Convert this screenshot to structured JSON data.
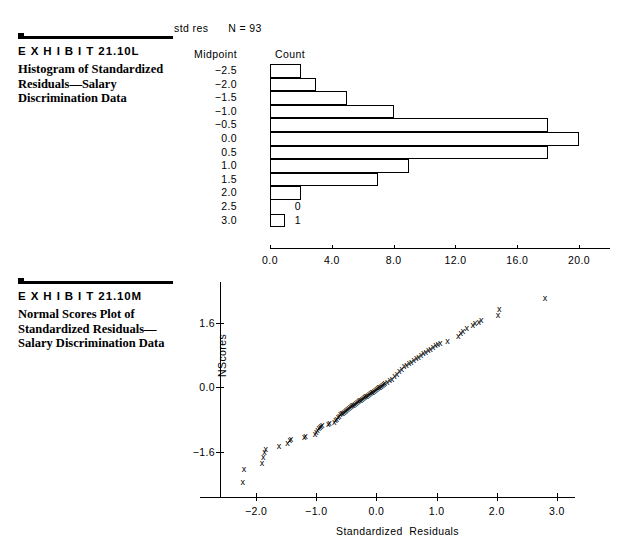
{
  "exhibit_l": {
    "label": "E X H I B I T   21.10L",
    "title": "Histogram of Standardized Residuals—Salary Discrimination Data",
    "header_line": "std res      N = 93",
    "column_headers": {
      "midpoint": "Midpoint",
      "count": "Count"
    }
  },
  "exhibit_m": {
    "label": "E X H I B I T   21.10M",
    "title": "Normal Scores Plot of Standardized Residuals—Salary Discrimination Data"
  },
  "chart_data": [
    {
      "type": "bar",
      "orientation": "horizontal",
      "title": "Histogram of Standardized Residuals—Salary Discrimination Data",
      "subtitle": "std res      N = 93",
      "xlabel": "",
      "ylabel": "Midpoint",
      "n": 93,
      "categories": [
        "-2.5",
        "-2.0",
        "-1.5",
        "-1.0",
        "-0.5",
        "0.0",
        "0.5",
        "1.0",
        "1.5",
        "2.0",
        "2.5",
        "3.0"
      ],
      "values": [
        2,
        3,
        5,
        8,
        18,
        20,
        18,
        9,
        7,
        2,
        0,
        1
      ],
      "xlim": [
        0,
        22
      ],
      "xticks": [
        0,
        4,
        8,
        12,
        16,
        20
      ],
      "xticklabels": [
        "0.0",
        "4.0",
        "8.0",
        "12.0",
        "16.0",
        "20.0"
      ],
      "grid": false,
      "legend": "none"
    },
    {
      "type": "scatter",
      "title": "Normal Scores Plot of Standardized Residuals—Salary Discrimination Data",
      "xlabel": "Standardized  Residuals",
      "ylabel": "NScores",
      "marker": "x",
      "xlim": [
        -2.6,
        3.3
      ],
      "ylim": [
        -2.7,
        2.6
      ],
      "xticks": [
        -2.0,
        -1.0,
        0.0,
        1.0,
        2.0,
        3.0
      ],
      "xticklabels": [
        "-2.0",
        "-1.0",
        "0.0",
        "1.0",
        "2.0",
        "3.0"
      ],
      "yticks": [
        1.6,
        0.0,
        -1.6
      ],
      "yticklabels": [
        "1.6",
        "0.0",
        "-1.6"
      ],
      "grid": false,
      "legend": "none",
      "points": [
        [
          -2.22,
          -2.34
        ],
        [
          -2.2,
          -2.02
        ],
        [
          -1.9,
          -1.86
        ],
        [
          -1.88,
          -1.72
        ],
        [
          -1.86,
          -1.58
        ],
        [
          -1.84,
          -1.52
        ],
        [
          -1.62,
          -1.45
        ],
        [
          -1.48,
          -1.36
        ],
        [
          -1.44,
          -1.3
        ],
        [
          -1.42,
          -1.28
        ],
        [
          -1.2,
          -1.22
        ],
        [
          -1.18,
          -1.2
        ],
        [
          -1.02,
          -1.14
        ],
        [
          -1.0,
          -1.1
        ],
        [
          -0.98,
          -1.04
        ],
        [
          -0.96,
          -1.0
        ],
        [
          -0.94,
          -0.97
        ],
        [
          -0.92,
          -0.94
        ],
        [
          -0.9,
          -0.92
        ],
        [
          -0.8,
          -0.9
        ],
        [
          -0.78,
          -0.88
        ],
        [
          -0.7,
          -0.84
        ],
        [
          -0.68,
          -0.8
        ],
        [
          -0.66,
          -0.78
        ],
        [
          -0.64,
          -0.74
        ],
        [
          -0.62,
          -0.7
        ],
        [
          -0.6,
          -0.66
        ],
        [
          -0.58,
          -0.64
        ],
        [
          -0.56,
          -0.62
        ],
        [
          -0.54,
          -0.6
        ],
        [
          -0.52,
          -0.58
        ],
        [
          -0.5,
          -0.55
        ],
        [
          -0.48,
          -0.52
        ],
        [
          -0.46,
          -0.5
        ],
        [
          -0.44,
          -0.48
        ],
        [
          -0.42,
          -0.46
        ],
        [
          -0.4,
          -0.44
        ],
        [
          -0.38,
          -0.42
        ],
        [
          -0.36,
          -0.4
        ],
        [
          -0.34,
          -0.38
        ],
        [
          -0.32,
          -0.36
        ],
        [
          -0.3,
          -0.34
        ],
        [
          -0.28,
          -0.32
        ],
        [
          -0.26,
          -0.3
        ],
        [
          -0.24,
          -0.28
        ],
        [
          -0.22,
          -0.26
        ],
        [
          -0.2,
          -0.24
        ],
        [
          -0.18,
          -0.22
        ],
        [
          -0.16,
          -0.2
        ],
        [
          -0.14,
          -0.18
        ],
        [
          -0.12,
          -0.16
        ],
        [
          -0.1,
          -0.14
        ],
        [
          -0.08,
          -0.12
        ],
        [
          -0.06,
          -0.1
        ],
        [
          -0.04,
          -0.08
        ],
        [
          -0.02,
          -0.06
        ],
        [
          0.0,
          -0.04
        ],
        [
          0.02,
          -0.02
        ],
        [
          0.04,
          0.0
        ],
        [
          0.06,
          0.02
        ],
        [
          0.08,
          0.04
        ],
        [
          0.1,
          0.06
        ],
        [
          0.12,
          0.08
        ],
        [
          0.14,
          0.1
        ],
        [
          0.18,
          0.14
        ],
        [
          0.22,
          0.18
        ],
        [
          0.26,
          0.22
        ],
        [
          0.3,
          0.28
        ],
        [
          0.34,
          0.34
        ],
        [
          0.38,
          0.4
        ],
        [
          0.42,
          0.46
        ],
        [
          0.46,
          0.52
        ],
        [
          0.5,
          0.56
        ],
        [
          0.54,
          0.6
        ],
        [
          0.58,
          0.64
        ],
        [
          0.62,
          0.68
        ],
        [
          0.66,
          0.72
        ],
        [
          0.7,
          0.76
        ],
        [
          0.74,
          0.8
        ],
        [
          0.78,
          0.84
        ],
        [
          0.82,
          0.88
        ],
        [
          0.86,
          0.92
        ],
        [
          0.9,
          0.96
        ],
        [
          0.94,
          1.0
        ],
        [
          0.98,
          1.04
        ],
        [
          1.02,
          1.08
        ],
        [
          1.06,
          1.1
        ],
        [
          1.18,
          1.14
        ],
        [
          1.36,
          1.26
        ],
        [
          1.4,
          1.34
        ],
        [
          1.44,
          1.4
        ],
        [
          1.5,
          1.46
        ],
        [
          1.6,
          1.54
        ],
        [
          1.64,
          1.58
        ],
        [
          1.7,
          1.62
        ],
        [
          1.74,
          1.66
        ],
        [
          2.02,
          1.78
        ],
        [
          2.04,
          1.94
        ],
        [
          2.8,
          2.2
        ]
      ]
    }
  ]
}
